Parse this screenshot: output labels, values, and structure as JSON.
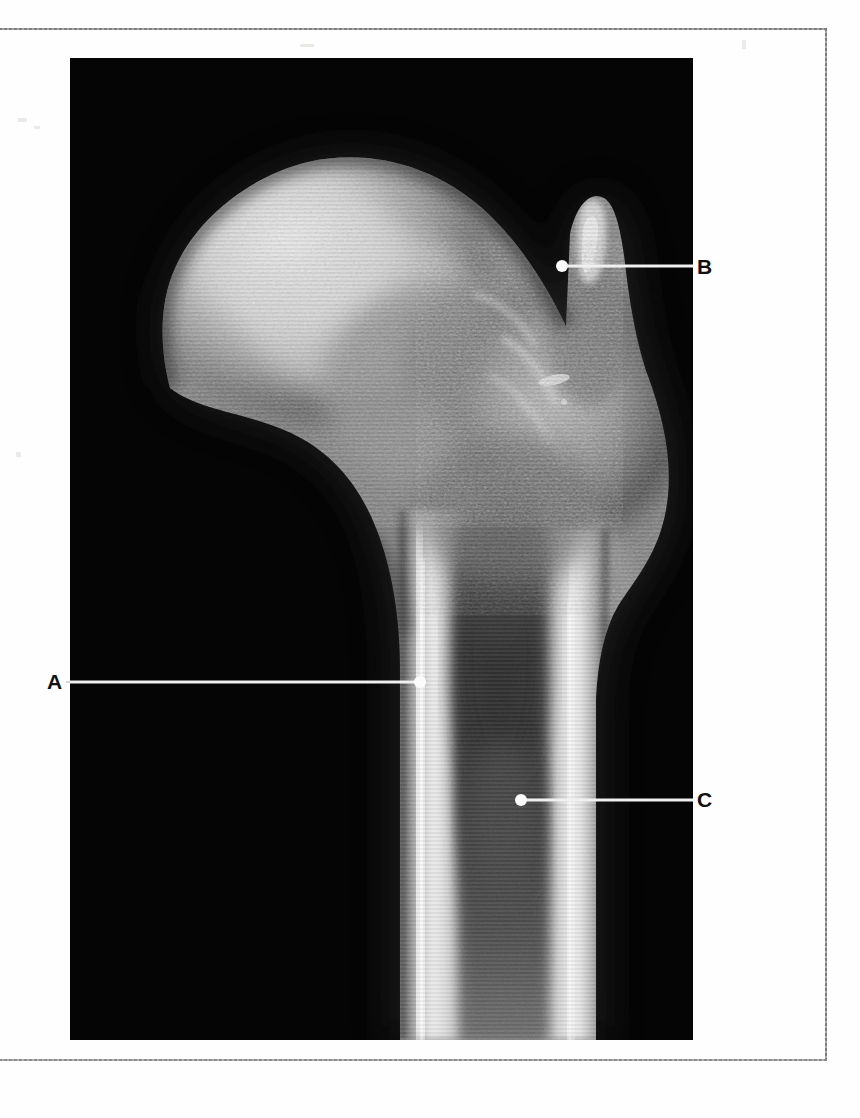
{
  "page": {
    "background_color": "#fefefe",
    "frame_color": "#8e8e8e",
    "width": 860,
    "height": 1118
  },
  "figure": {
    "type": "radiograph",
    "plate": {
      "x": 70,
      "y": 58,
      "width": 623,
      "height": 982,
      "background_color": "#040404",
      "bone_bright_color": "#f2f2f2",
      "bone_mid_color": "#9a9a9a",
      "cavity_color": "#3c3c3c"
    },
    "leaders": [
      {
        "id": "A",
        "label": "A",
        "label_x": 47,
        "label_y": 671,
        "dot_x": 420,
        "dot_y": 682,
        "line_from_x": 70,
        "line_to_x": 420,
        "line_y": 682,
        "side": "left",
        "color": "#f0f0f0"
      },
      {
        "id": "B",
        "label": "B",
        "label_x": 697,
        "label_y": 256,
        "dot_x": 562,
        "dot_y": 266,
        "line_from_x": 562,
        "line_to_x": 693,
        "line_y": 266,
        "side": "right",
        "color": "#f0f0f0"
      },
      {
        "id": "C",
        "label": "C",
        "label_x": 697,
        "label_y": 789,
        "dot_x": 521,
        "dot_y": 800,
        "line_from_x": 521,
        "line_to_x": 693,
        "line_y": 800,
        "side": "right",
        "color": "#f0f0f0"
      }
    ]
  }
}
